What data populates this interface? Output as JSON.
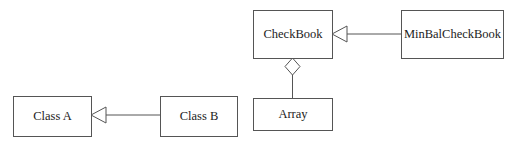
{
  "diagram": {
    "type": "UML class diagram",
    "classes": [
      {
        "id": "class-a",
        "label": "Class A"
      },
      {
        "id": "class-b",
        "label": "Class B"
      },
      {
        "id": "checkbook",
        "label": "CheckBook"
      },
      {
        "id": "minbal-checkbook",
        "label": "MinBalCheckBook"
      },
      {
        "id": "array",
        "label": "Array"
      }
    ],
    "relationships": [
      {
        "type": "generalization",
        "from": "Class B",
        "to": "Class A"
      },
      {
        "type": "generalization",
        "from": "MinBalCheckBook",
        "to": "CheckBook"
      },
      {
        "type": "aggregation",
        "whole": "CheckBook",
        "part": "Array"
      }
    ],
    "colors": {
      "stroke": "#555555",
      "text": "#222222",
      "background": "#ffffff"
    }
  }
}
